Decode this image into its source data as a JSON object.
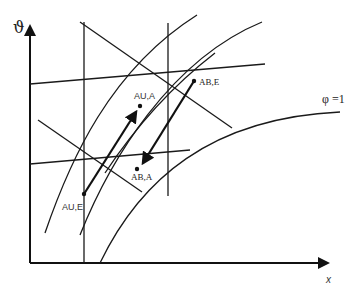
{
  "diagram": {
    "axes": {
      "y_label": "ϑ",
      "x_label": "x"
    },
    "curve_label": "φ =1",
    "points": [
      {
        "id": "AU_E",
        "label": "AU,E"
      },
      {
        "id": "AU_A",
        "label": "AU,A"
      },
      {
        "id": "AB_E",
        "label": "AB,E"
      },
      {
        "id": "AB_A",
        "label": "AB,A"
      }
    ],
    "arrows": [
      {
        "from": "AU,E",
        "to": "AU,A",
        "direction": "up-right"
      },
      {
        "from": "AB,E",
        "to": "AB,A",
        "direction": "down-left"
      }
    ],
    "colors": {
      "line": "#1a1a1a",
      "background": "#ffffff"
    }
  }
}
